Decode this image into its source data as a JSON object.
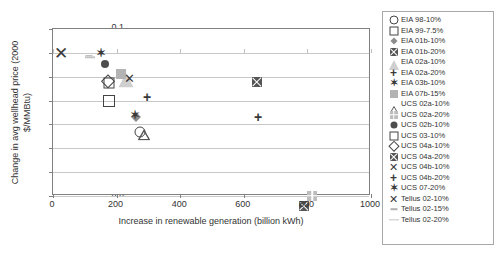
{
  "chart_data": {
    "type": "scatter",
    "title": "",
    "xlabel": "Increase in renewable generation (billion kWh)",
    "ylabel": "Change in avg wellhead price (2000 $/MMBtu)",
    "xlim": [
      0,
      1000
    ],
    "ylim": [
      -0.6,
      0.1
    ],
    "xticks": [
      "0",
      "200",
      "400",
      "600",
      "800",
      "1000"
    ],
    "yticks": [
      "0.1",
      "0.0",
      "-0.1",
      "-0.2",
      "-0.3",
      "-0.4",
      "-0.5",
      "-0.6"
    ],
    "grid": "horizontal",
    "legend_position": "right-outside",
    "series": [
      {
        "name": "EIA 98-10%",
        "marker": "circle-open",
        "color": "#444444",
        "x": 275,
        "y": -0.33
      },
      {
        "name": "EIA 99-7.5%",
        "marker": "square-open",
        "color": "#444444",
        "x": 175,
        "y": -0.2
      },
      {
        "name": "EIA 01b-10%",
        "marker": "diamond-fill",
        "color": "#8c8c8c",
        "x": 262,
        "y": -0.268
      },
      {
        "name": "EIA 01b-20%",
        "marker": "square-x",
        "color": "#555555",
        "x": 640,
        "y": -0.122
      },
      {
        "name": "EIA 02a-10%",
        "marker": "triangle-fill",
        "color": "#cfcfcf",
        "x": 228,
        "y": -0.115
      },
      {
        "name": "EIA 02a-20%",
        "marker": "plus",
        "color": "#3a3a3a",
        "x": 296,
        "y": -0.185
      },
      {
        "name": "EIA 03b-10%",
        "marker": "x-star",
        "color": "#3a3a3a",
        "x": 150,
        "y": 0.0
      },
      {
        "name": "EIA 07b-15%",
        "marker": "square-fill",
        "color": "#b3b3b3",
        "x": 213,
        "y": -0.088
      },
      {
        "name": "UCS 02a-10%",
        "marker": "triangle-open",
        "color": "#555555",
        "x": 287,
        "y": -0.332
      },
      {
        "name": "UCS 02a-20%",
        "marker": "square-grid",
        "color": "#bdbdbd",
        "x": 815,
        "y": -0.558
      },
      {
        "name": "UCS 02b-10%",
        "marker": "circle-fill",
        "color": "#4d4d4d",
        "x": 164,
        "y": -0.046
      },
      {
        "name": "UCS 03-10%",
        "marker": "square-open",
        "color": "#444444",
        "x": 175,
        "y": -0.125
      },
      {
        "name": "UCS 04a-10%",
        "marker": "diamond-open",
        "color": "#444444",
        "x": 172,
        "y": -0.118
      },
      {
        "name": "UCS 04a-20%",
        "marker": "square-x",
        "color": "#555555",
        "x": 790,
        "y": -0.558
      },
      {
        "name": "UCS 04b-10%",
        "marker": "x-cross",
        "color": "#3a3a3a",
        "x": 239,
        "y": -0.107
      },
      {
        "name": "UCS 04b-20%",
        "marker": "plus",
        "color": "#3a3a3a",
        "x": 645,
        "y": -0.268
      },
      {
        "name": "UCS 07-20%",
        "marker": "x-star",
        "color": "#3a3a3a",
        "x": 258,
        "y": -0.262
      },
      {
        "name": "Tellus 02-10%",
        "marker": "x-cross",
        "color": "#3a3a3a",
        "x": 25,
        "y": 0.0
      },
      {
        "name": "Tellus 02-15%",
        "marker": "dash-short",
        "color": "#b0b0b0",
        "x": 112,
        "y": -0.012
      },
      {
        "name": "Tellus 02-20%",
        "marker": "dash-long",
        "color": "#c4c4c4",
        "x": 116,
        "y": -0.018
      }
    ]
  },
  "axes": {
    "x_title": "Increase in renewable generation (billion kWh)",
    "y_title": "Change in avg wellhead price (2000 $/MMBtu)",
    "x_ticks": [
      "0",
      "200",
      "400",
      "600",
      "800",
      "1000"
    ],
    "y_ticks": [
      "0.1",
      "0.0",
      "-0.1",
      "-0.2",
      "-0.3",
      "-0.4",
      "-0.5",
      "-0.6"
    ]
  },
  "legend": {
    "items": [
      {
        "label": "EIA 98-10%"
      },
      {
        "label": "EIA 99-7.5%"
      },
      {
        "label": "EIA 01b-10%"
      },
      {
        "label": "EIA 01b-20%"
      },
      {
        "label": "EIA 02a-10%"
      },
      {
        "label": "EIA 02a-20%"
      },
      {
        "label": "EIA 03b-10%"
      },
      {
        "label": "EIA 07b-15%"
      },
      {
        "label": "UCS 02a-10%"
      },
      {
        "label": "UCS 02a-20%"
      },
      {
        "label": "UCS 02b-10%"
      },
      {
        "label": "UCS 03-10%"
      },
      {
        "label": "UCS 04a-10%"
      },
      {
        "label": "UCS 04a-20%"
      },
      {
        "label": "UCS 04b-10%"
      },
      {
        "label": "UCS 04b-20%"
      },
      {
        "label": "UCS 07-20%"
      },
      {
        "label": "Tellus 02-10%"
      },
      {
        "label": "Tellus 02-15%"
      },
      {
        "label": "Tellus 02-20%"
      }
    ]
  },
  "colors": {
    "axis": "#808080",
    "grid": "#c8c8c8",
    "text": "#333333",
    "legend_border": "#a8a8a8"
  }
}
